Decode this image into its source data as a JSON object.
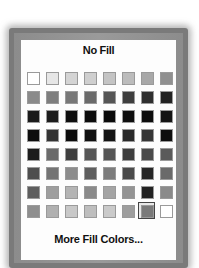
{
  "menu": {
    "no_fill_label": "No Fill",
    "more_colors_label": "More Fill Colors...",
    "selected": {
      "row": 7,
      "col": 6
    }
  },
  "palette": {
    "rows": [
      [
        "#ffffff",
        "#e6e6e6",
        "#d4d4d4",
        "#cfcfcf",
        "#c4c4c4",
        "#bcbcbc",
        "#a8a8a8",
        "#909090"
      ],
      [
        "#8a8a8a",
        "#7e7e7e",
        "#787878",
        "#6a6a6a",
        "#555555",
        "#3e3e3e",
        "#2e2e2e",
        "#222222"
      ],
      [
        "#1a1a1a",
        "#1c1c1c",
        "#0e0e0e",
        "#0c0c0c",
        "#0a0a0a",
        "#0e0e0e",
        "#0c0c0c",
        "#141414"
      ],
      [
        "#0e0e0e",
        "#333333",
        "#0c0c0c",
        "#101010",
        "#141414",
        "#2a2a2a",
        "#363636",
        "#0e0e0e"
      ],
      [
        "#1c1c1c",
        "#6a6a6a",
        "#3e3e3e",
        "#565656",
        "#555555",
        "#3e3e3e",
        "#4a4a4a",
        "#5a5a5a"
      ],
      [
        "#4e4e4e",
        "#747474",
        "#8c8c8c",
        "#5e5e5e",
        "#7c7c7c",
        "#4a4a4a",
        "#262626",
        "#6a6a6a"
      ],
      [
        "#5e5e5e",
        "#9e9e9e",
        "#b4b4b4",
        "#8a8a8a",
        "#a4a4a4",
        "#949494",
        "#222222",
        "#8a8a8a"
      ],
      [
        "#8e8e8e",
        "#b0b0b0",
        "#c8c8c8",
        "#bebebe",
        "#cacaca",
        "#9e9e9e",
        "#7a7a7a",
        "#ffffff"
      ]
    ]
  },
  "colors": {
    "frame": "#7a7a7a",
    "panel": "#fdfdfd",
    "swatch_border": "#9a9a9a",
    "selection_ring": "#444444"
  }
}
